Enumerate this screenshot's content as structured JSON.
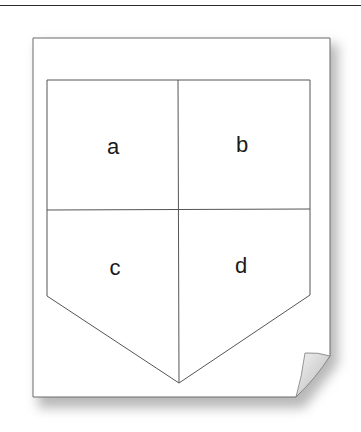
{
  "diagram": {
    "type": "shield-division",
    "quarters": [
      {
        "id": "a",
        "label": "a",
        "position": "top-left"
      },
      {
        "id": "b",
        "label": "b",
        "position": "top-right"
      },
      {
        "id": "c",
        "label": "c",
        "position": "bottom-left"
      },
      {
        "id": "d",
        "label": "d",
        "position": "bottom-right"
      }
    ],
    "colors": {
      "line": "#555555",
      "paper": "#ffffff",
      "paper_edge": "#6a6a6a",
      "shadow": "#b8b8b8",
      "text": "#1a1a1a"
    }
  }
}
